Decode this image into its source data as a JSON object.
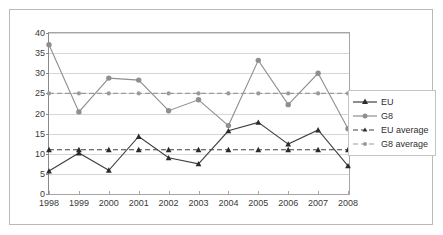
{
  "chart_data": {
    "type": "line",
    "title": "",
    "xlabel": "",
    "ylabel": "",
    "categories": [
      "1998",
      "1999",
      "2000",
      "2001",
      "2002",
      "2003",
      "2004",
      "2005",
      "2006",
      "2007",
      "2008"
    ],
    "ylim": [
      0,
      40
    ],
    "ytick_labels": [
      "0",
      "5",
      "10",
      "15",
      "20",
      "25",
      "30",
      "35",
      "40"
    ],
    "ytick_values": [
      0,
      5,
      10,
      15,
      20,
      25,
      30,
      35,
      40
    ],
    "grid": true,
    "legend_position": "right",
    "series": [
      {
        "name": "EU",
        "marker": "triangle",
        "line_style": "solid",
        "color": "#404040",
        "values": [
          5.7,
          10.2,
          5.9,
          14.3,
          9.0,
          7.5,
          15.7,
          17.8,
          12.4,
          15.9,
          7.0
        ]
      },
      {
        "name": "G8",
        "marker": "circle",
        "line_style": "solid",
        "color": "#8f8f8f",
        "values": [
          37.1,
          20.4,
          28.8,
          28.3,
          20.7,
          23.4,
          17.0,
          33.2,
          22.2,
          30.0,
          16.2
        ]
      },
      {
        "name": "EU average",
        "marker": "triangle",
        "line_style": "dashed",
        "color": "#404040",
        "values": [
          11,
          11,
          11,
          11,
          11,
          11,
          11,
          11,
          11,
          11,
          11
        ]
      },
      {
        "name": "G8 average",
        "marker": "circle",
        "line_style": "dashed",
        "color": "#9a9a9a",
        "values": [
          25,
          25,
          25,
          25,
          25,
          25,
          25,
          25,
          25,
          25,
          25
        ]
      }
    ]
  },
  "legend": {
    "items": [
      {
        "label": "EU"
      },
      {
        "label": "G8"
      },
      {
        "label": "EU average"
      },
      {
        "label": "G8 average"
      }
    ]
  },
  "colors": {
    "eu": "#404040",
    "g8": "#8f8f8f",
    "eu_average": "#404040",
    "g8_average": "#9a9a9a",
    "grid": "#d6d6d6",
    "axis": "#a6a6a6",
    "frame": "#b9b9b9",
    "text": "#3a3a3a"
  }
}
